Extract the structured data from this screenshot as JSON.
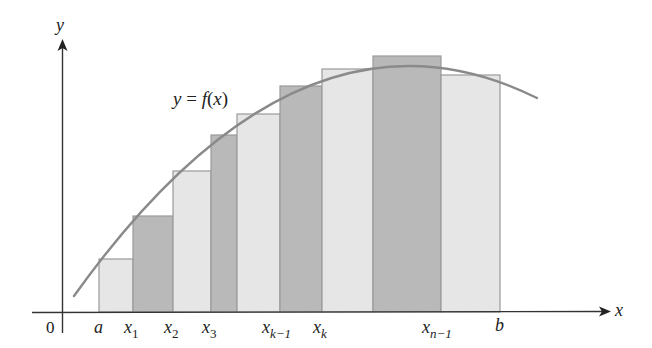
{
  "figure": {
    "curve_label": {
      "y": "y",
      "eq": " = ",
      "f": "f",
      "paren_open": "(",
      "x": "x",
      "paren_close": ")"
    },
    "axis": {
      "x_label": "x",
      "y_label": "y",
      "origin_label": "0"
    },
    "tick_labels": [
      {
        "main": "a",
        "sub": ""
      },
      {
        "main": "x",
        "sub": "1"
      },
      {
        "main": "x",
        "sub": "2"
      },
      {
        "main": "x",
        "sub": "3"
      },
      {
        "main": "x",
        "sub": "k−1"
      },
      {
        "main": "x",
        "sub": "k"
      },
      {
        "main": "x",
        "sub": "n−1"
      },
      {
        "main": "b",
        "sub": ""
      }
    ],
    "colors": {
      "light_bar": "#e6e6e6",
      "dark_bar": "#b9b9b9",
      "bar_outline": "#9a9a9a",
      "curve": "#8a8a8a",
      "axis": "#333333"
    }
  },
  "chart_data": {
    "type": "bar",
    "title": "",
    "xlabel": "x",
    "ylabel": "y",
    "curve": "y = f(x)",
    "categories": [
      "[a,x1]",
      "[x1,x2]",
      "[x2,x3]",
      "[x3,·]",
      "[·,x(k-1)]",
      "[x(k-1),xk]",
      "[xk,·]",
      "[·,x(n-1)]",
      "[x(n-1),b]"
    ],
    "rectangles": [
      {
        "x0": 99,
        "x1": 133,
        "top": 259,
        "shade": "light"
      },
      {
        "x0": 133,
        "x1": 173,
        "top": 216,
        "shade": "dark"
      },
      {
        "x0": 173,
        "x1": 211,
        "top": 171,
        "shade": "light"
      },
      {
        "x0": 211,
        "x1": 237,
        "top": 135,
        "shade": "dark"
      },
      {
        "x0": 237,
        "x1": 280,
        "top": 114,
        "shade": "light"
      },
      {
        "x0": 280,
        "x1": 322,
        "top": 86,
        "shade": "dark"
      },
      {
        "x0": 322,
        "x1": 373,
        "top": 69,
        "shade": "light"
      },
      {
        "x0": 373,
        "x1": 441,
        "top": 56,
        "shade": "dark"
      },
      {
        "x0": 441,
        "x1": 500,
        "top": 75,
        "shade": "light"
      }
    ],
    "baseline_y": 312,
    "legend": "none",
    "grid": false
  }
}
